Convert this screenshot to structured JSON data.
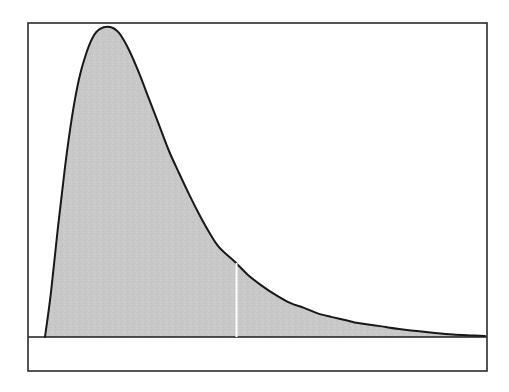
{
  "figure": {
    "background_color": "#ffffff",
    "width": 509,
    "height": 392,
    "title": "",
    "caption": ""
  },
  "frame": {
    "name": "plot-border",
    "stroke_color": "#2b2b2b",
    "left": 28,
    "top": 23,
    "right": 487,
    "bottom": 371
  },
  "axis": {
    "baseline_y": 337,
    "baseline_color": "#1c1c1c",
    "x_axis_label": "",
    "y_axis_label": "",
    "x_tick_labels": [],
    "y_tick_labels": []
  },
  "curve": {
    "fill_color": "#c8c8c8",
    "outline_color": "#18181a",
    "noise_color": "#bdbdbd"
  },
  "divider": {
    "name": "critical-value-line",
    "color": "#ffffff",
    "x": 236.5,
    "y_top": 263,
    "y_bottom": 337,
    "label": ""
  },
  "chart_data": {
    "type": "area",
    "title": "",
    "subtitle": "",
    "xlabel": "",
    "ylabel": "",
    "grid": false,
    "legend": null,
    "legend_position": "none",
    "xlim": [
      0,
      100
    ],
    "ylim": [
      0,
      1
    ],
    "x_pixel_range": [
      28,
      487
    ],
    "y_pixel_baseline": 337,
    "y_pixel_peak": 27,
    "peak": {
      "x": 18.0,
      "y": 1.0,
      "x_pixel": 110,
      "y_pixel": 27
    },
    "curve_start": {
      "x": 3.7,
      "y": 0.0,
      "x_pixel": 45,
      "y_pixel": 337
    },
    "divider_x": 45.3,
    "divider_y": 0.239,
    "x": [
      3.7,
      5.0,
      6.5,
      8.0,
      9.5,
      11.0,
      12.5,
      14.0,
      15.5,
      18.0,
      20.0,
      22.2,
      24.4,
      26.6,
      28.8,
      31.0,
      33.2,
      35.4,
      37.6,
      39.8,
      42.0,
      45.3,
      48.0,
      51.0,
      54.0,
      57.0,
      60.0,
      63.0,
      66.0,
      69.0,
      72.0,
      75.0,
      78.0,
      81.0,
      85.0,
      89.0,
      93.0,
      97.0,
      100.0
    ],
    "y": [
      0.0,
      0.145,
      0.355,
      0.548,
      0.71,
      0.832,
      0.913,
      0.968,
      0.994,
      1.0,
      0.981,
      0.926,
      0.852,
      0.768,
      0.684,
      0.6,
      0.529,
      0.461,
      0.397,
      0.339,
      0.29,
      0.239,
      0.2,
      0.165,
      0.135,
      0.11,
      0.094,
      0.077,
      0.065,
      0.055,
      0.045,
      0.039,
      0.032,
      0.026,
      0.019,
      0.013,
      0.008,
      0.005,
      0.003
    ],
    "x_pixel_points": [
      45,
      51,
      58,
      65,
      72,
      79,
      86,
      93,
      100,
      110,
      119,
      129,
      139,
      149,
      159,
      169,
      179,
      189,
      199,
      209,
      219,
      236,
      248,
      262,
      276,
      290,
      304,
      317,
      331,
      345,
      358,
      372,
      386,
      399,
      417,
      435,
      453,
      471,
      485
    ],
    "y_pixel_points": [
      337,
      292,
      220,
      154,
      98,
      56,
      28,
      9,
      0,
      0,
      7,
      26,
      51,
      80,
      109,
      138,
      162,
      185,
      207,
      227,
      244,
      262,
      275,
      287,
      297,
      306,
      311,
      317,
      321,
      324,
      328,
      330,
      332,
      334,
      335,
      336,
      336,
      337,
      337
    ]
  }
}
